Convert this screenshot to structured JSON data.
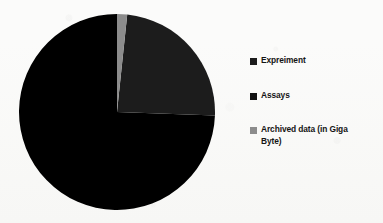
{
  "chart_data": {
    "type": "pie",
    "title": "",
    "subtitle": "",
    "xlabel": "",
    "ylabel": "",
    "grid": false,
    "legend_position": "right",
    "start_angle_deg": 0,
    "direction": "clockwise",
    "categories": [
      "Expreiment",
      "Assays",
      "Archived data (in Giga Byte)"
    ],
    "values": [
      74,
      24,
      2
    ],
    "unit": "percent",
    "slices": [
      {
        "label": "Expreiment",
        "value": 74,
        "percent": 74,
        "color": "#000000",
        "start_angle_deg": 92,
        "end_angle_deg": 360,
        "sweep_deg": 268
      },
      {
        "label": "Assays",
        "value": 24,
        "percent": 24,
        "color": "#1c1c1c",
        "start_angle_deg": 6,
        "end_angle_deg": 92,
        "sweep_deg": 86
      },
      {
        "label": "Archived data (in Giga Byte)",
        "value": 2,
        "percent": 2,
        "color": "#8c8c8c",
        "start_angle_deg": 0,
        "end_angle_deg": 6,
        "sweep_deg": 6
      }
    ]
  },
  "legend": {
    "items": [
      {
        "label": "Expreiment",
        "color": "#1c1c1c",
        "swatch": "square-marker-icon"
      },
      {
        "label": "Assays",
        "color": "#111111",
        "swatch": "square-marker-icon"
      },
      {
        "label": "Archived data (in Giga\nByte)",
        "color": "#8c8c8c",
        "swatch": "square-marker-icon"
      }
    ]
  },
  "colors": {
    "background": "#fbfbfa",
    "slice_experiment": "#000000",
    "slice_assays": "#1c1c1c",
    "slice_archived": "#8c8c8c",
    "text": "#141414"
  }
}
